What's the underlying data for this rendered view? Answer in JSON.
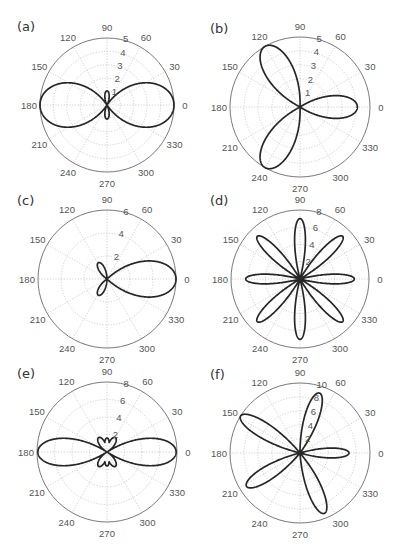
{
  "figure": {
    "panels": [
      "a",
      "b",
      "c",
      "d",
      "e",
      "f"
    ]
  },
  "chart_data": [
    {
      "id": "a",
      "label": "(a)",
      "type": "polar-line",
      "center": [
        107,
        105
      ],
      "radius": 67,
      "rmax": 5,
      "rticks": [
        1,
        2,
        3,
        4,
        5
      ],
      "rtick_labels": [
        "1",
        "2",
        "3",
        "4",
        "5"
      ],
      "angle_ticks": [
        0,
        30,
        60,
        90,
        120,
        150,
        180,
        210,
        240,
        270,
        300,
        330
      ],
      "angle_tick_labels": [
        "0",
        "30",
        "60",
        "90",
        "120",
        "150",
        "180",
        "210",
        "240",
        "270",
        "300",
        "330"
      ],
      "curve": {
        "description": "two-lobe figure eight along 0°/180° (length ~5) with small lobes along 90°/270° (length ~1)",
        "lobes": [
          {
            "angle": 0,
            "length": 5,
            "width": 0.62
          },
          {
            "angle": 180,
            "length": 5,
            "width": 0.62
          },
          {
            "angle": 90,
            "length": 1.05,
            "width": 0.28
          },
          {
            "angle": 270,
            "length": 1.05,
            "width": 0.28
          }
        ]
      }
    },
    {
      "id": "b",
      "label": "(b)",
      "type": "polar-line",
      "center": [
        300,
        107
      ],
      "radius": 70,
      "rmax": 5,
      "rticks": [
        1,
        2,
        3,
        4,
        5
      ],
      "rtick_labels": [
        "1",
        "2",
        "3",
        "4",
        "5"
      ],
      "angle_ticks": [
        0,
        30,
        60,
        90,
        120,
        150,
        180,
        210,
        240,
        270,
        300,
        330
      ],
      "angle_tick_labels": [
        "0",
        "30",
        "60",
        "90",
        "120",
        "150",
        "180",
        "210",
        "240",
        "270",
        "300",
        "330"
      ],
      "curve": {
        "description": "three-petal rose, petals at 0° (~4), 120° (~5), 240° (~5)",
        "lobes": [
          {
            "angle": 0,
            "length": 4.1,
            "width": 0.36
          },
          {
            "angle": 120,
            "length": 5,
            "width": 0.36
          },
          {
            "angle": 240,
            "length": 5,
            "width": 0.36
          }
        ]
      }
    },
    {
      "id": "c",
      "label": "(c)",
      "type": "polar-line",
      "center": [
        107,
        279
      ],
      "radius": 69,
      "rmax": 6,
      "rticks": [
        2,
        4,
        6
      ],
      "rtick_labels": [
        "2",
        "4",
        "6"
      ],
      "angle_ticks": [
        0,
        30,
        60,
        90,
        120,
        150,
        180,
        210,
        240,
        270,
        300,
        330
      ],
      "angle_tick_labels": [
        "0",
        "30",
        "60",
        "90",
        "120",
        "150",
        "180",
        "210",
        "240",
        "270",
        "300",
        "330"
      ],
      "curve": {
        "description": "one large lobe at 0° (~6) with two small lobes at ~120° and ~240° (~1.6)",
        "lobes": [
          {
            "angle": 0,
            "length": 6,
            "width": 0.48
          },
          {
            "angle": 118,
            "length": 1.6,
            "width": 0.3
          },
          {
            "angle": 242,
            "length": 1.6,
            "width": 0.3
          }
        ]
      }
    },
    {
      "id": "d",
      "label": "(d)",
      "type": "polar-line",
      "center": [
        300,
        279
      ],
      "radius": 69,
      "rmax": 8,
      "rticks": [
        2,
        4,
        6,
        8
      ],
      "rtick_labels": [
        "2",
        "4",
        "6",
        "8"
      ],
      "angle_ticks": [
        0,
        30,
        60,
        90,
        120,
        150,
        180,
        210,
        240,
        270,
        300,
        330
      ],
      "angle_tick_labels": [
        "0",
        "30",
        "60",
        "90",
        "120",
        "150",
        "180",
        "210",
        "240",
        "270",
        "300",
        "330"
      ],
      "curve": {
        "description": "eight-petal rose, petals every 45°, length ~6.3-7",
        "lobes": [
          {
            "angle": 0,
            "length": 6.3,
            "width": 0.16
          },
          {
            "angle": 45,
            "length": 7,
            "width": 0.16
          },
          {
            "angle": 90,
            "length": 7,
            "width": 0.16
          },
          {
            "angle": 135,
            "length": 7,
            "width": 0.16
          },
          {
            "angle": 180,
            "length": 6.3,
            "width": 0.16
          },
          {
            "angle": 225,
            "length": 7,
            "width": 0.16
          },
          {
            "angle": 270,
            "length": 7,
            "width": 0.16
          },
          {
            "angle": 315,
            "length": 7,
            "width": 0.16
          }
        ]
      }
    },
    {
      "id": "e",
      "label": "(e)",
      "type": "polar-line",
      "center": [
        107,
        452
      ],
      "radius": 70,
      "rmax": 8,
      "rticks": [
        2,
        4,
        6,
        8
      ],
      "rtick_labels": [
        "2",
        "4",
        "6",
        "8"
      ],
      "angle_ticks": [
        0,
        30,
        60,
        90,
        120,
        150,
        180,
        210,
        240,
        270,
        300,
        330
      ],
      "angle_tick_labels": [
        "0",
        "30",
        "60",
        "90",
        "120",
        "150",
        "180",
        "210",
        "240",
        "270",
        "300",
        "330"
      ],
      "curve": {
        "description": "large lobes at 0°/180° (~8) with six small petals (~1.5-2) at 60,90,120,240,270,300",
        "lobes": [
          {
            "angle": 0,
            "length": 7.9,
            "width": 0.36
          },
          {
            "angle": 180,
            "length": 7.9,
            "width": 0.36
          },
          {
            "angle": 60,
            "length": 1.9,
            "width": 0.32
          },
          {
            "angle": 90,
            "length": 1.6,
            "width": 0.28
          },
          {
            "angle": 120,
            "length": 1.9,
            "width": 0.32
          },
          {
            "angle": 240,
            "length": 1.9,
            "width": 0.32
          },
          {
            "angle": 270,
            "length": 1.6,
            "width": 0.28
          },
          {
            "angle": 300,
            "length": 1.9,
            "width": 0.32
          }
        ]
      }
    },
    {
      "id": "f",
      "label": "(f)",
      "type": "polar-line",
      "center": [
        300,
        453
      ],
      "radius": 70,
      "rmax": 10,
      "rticks": [
        2,
        4,
        6,
        8,
        10
      ],
      "rtick_labels": [
        "2",
        "4",
        "6",
        "8",
        "10"
      ],
      "angle_ticks": [
        0,
        30,
        60,
        90,
        120,
        150,
        180,
        210,
        240,
        270,
        300,
        330
      ],
      "angle_tick_labels": [
        "0",
        "30",
        "60",
        "90",
        "120",
        "150",
        "180",
        "210",
        "240",
        "270",
        "300",
        "330"
      ],
      "curve": {
        "description": "five-petal rose with unequal petals: 0° (~7), ~72° (~9), ~148° (~10), ~212° (~9), ~292° (~9.3)",
        "lobes": [
          {
            "angle": 0,
            "length": 7,
            "width": 0.18
          },
          {
            "angle": 72,
            "length": 9,
            "width": 0.2
          },
          {
            "angle": 148,
            "length": 10,
            "width": 0.2
          },
          {
            "angle": 212,
            "length": 9,
            "width": 0.2
          },
          {
            "angle": 292,
            "length": 9.3,
            "width": 0.2
          }
        ]
      }
    }
  ]
}
